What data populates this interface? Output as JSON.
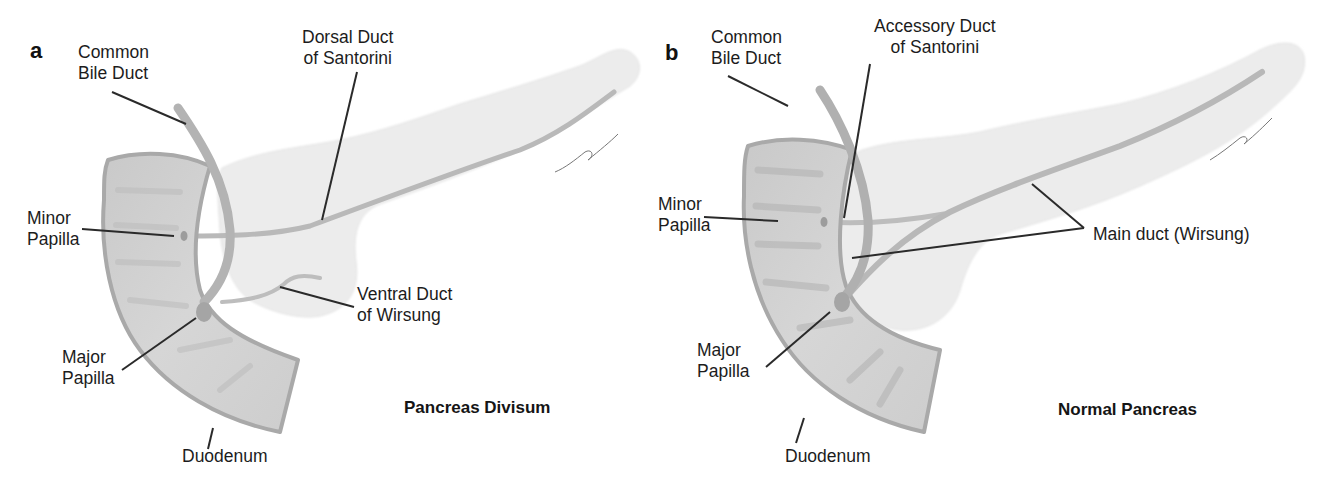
{
  "figure": {
    "panels": [
      {
        "letter": "a",
        "caption": "Pancreas Divisum",
        "labels": {
          "common_bile_duct_1": "Common",
          "common_bile_duct_2": "Bile Duct",
          "dorsal_duct_1": "Dorsal Duct",
          "dorsal_duct_2": "of Santorini",
          "minor_papilla_1": "Minor",
          "minor_papilla_2": "Papilla",
          "ventral_duct_1": "Ventral Duct",
          "ventral_duct_2": "of Wirsung",
          "major_papilla_1": "Major",
          "major_papilla_2": "Papilla",
          "duodenum": "Duodenum"
        }
      },
      {
        "letter": "b",
        "caption": "Normal Pancreas",
        "labels": {
          "common_bile_duct_1": "Common",
          "common_bile_duct_2": "Bile Duct",
          "accessory_duct_1": "Accessory Duct",
          "accessory_duct_2": "of Santorini",
          "minor_papilla_1": "Minor",
          "minor_papilla_2": "Papilla",
          "main_duct": "Main duct (Wirsung)",
          "major_papilla_1": "Major",
          "major_papilla_2": "Papilla",
          "duodenum": "Duodenum"
        }
      }
    ],
    "colors": {
      "pancreas_fill": "#ececec",
      "duodenum_fill": "#cfcfcf",
      "duodenum_edge": "#a8a8a8",
      "duct_fill": "#bdbdbd",
      "leader_line": "#2a2a2a"
    }
  }
}
